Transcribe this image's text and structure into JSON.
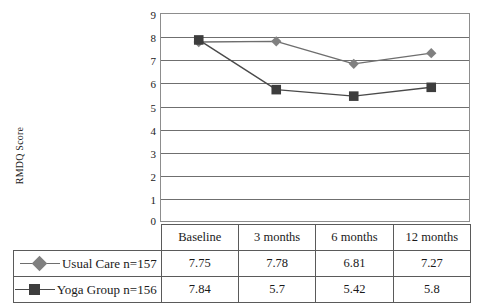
{
  "chart_data": {
    "type": "line",
    "title": "",
    "subtitle": "",
    "xlabel": "",
    "ylabel": "RMDQ Score",
    "ylim": [
      0,
      9
    ],
    "ytick_labels": [
      "9",
      "8",
      "7",
      "6",
      "5",
      "4",
      "3",
      "2",
      "1",
      "0"
    ],
    "grid": true,
    "legend_position": "table-left",
    "categories": [
      "Baseline",
      "3 months",
      "6 months",
      "12 months"
    ],
    "series": [
      {
        "name": "Usual Care n=157",
        "marker": "diamond",
        "color": "#808080",
        "line_color": "#6e6e6e",
        "values": [
          7.75,
          7.78,
          6.81,
          7.27
        ],
        "value_labels": [
          "7.75",
          "7.78",
          "6.81",
          "7.27"
        ]
      },
      {
        "name": "Yoga Group n=156",
        "marker": "square",
        "color": "#3d3d3d",
        "line_color": "#4a4a4a",
        "values": [
          7.84,
          5.7,
          5.42,
          5.8
        ],
        "value_labels": [
          "7.84",
          "5.7",
          "5.42",
          "5.8"
        ]
      }
    ]
  },
  "axis": {
    "y_title": "RMDQ Score",
    "y_ticks": [
      "9",
      "8",
      "7",
      "6",
      "5",
      "4",
      "3",
      "2",
      "1",
      "0"
    ]
  },
  "table": {
    "headers": [
      "Baseline",
      "3 months",
      "6 months",
      "12 months"
    ],
    "rows": [
      {
        "label": "Usual Care n=157",
        "values": [
          "7.75",
          "7.78",
          "6.81",
          "7.27"
        ]
      },
      {
        "label": "Yoga Group n=156",
        "values": [
          "7.84",
          "5.7",
          "5.42",
          "5.8"
        ]
      }
    ]
  },
  "colors": {
    "usual_care": "#808080",
    "yoga_group": "#3d3d3d",
    "grid": "#6f6f6f",
    "frame": "#8d8d8d",
    "table_border": "#5a5a5a"
  }
}
